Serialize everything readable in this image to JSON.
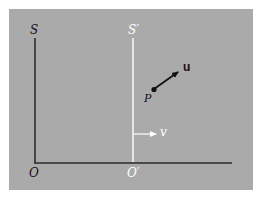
{
  "diagram": {
    "colors": {
      "page_background": "#ffffff",
      "panel_background": "#a9a9a9",
      "frame_S_axes": "#1a1a1a",
      "frame_S_prime_axis": "#ffffff",
      "vector_u": "#111111",
      "velocity_arrow_v": "#ffffff"
    },
    "frames": {
      "S": {
        "axis_label": "S",
        "origin_label": "O"
      },
      "S_prime": {
        "axis_label": "S′",
        "origin_label": "O′"
      }
    },
    "particle": {
      "label": "P",
      "velocity_label": "u"
    },
    "frame_velocity": {
      "label": "v"
    }
  }
}
